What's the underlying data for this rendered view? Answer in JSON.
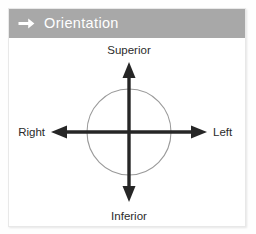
{
  "card": {
    "header": {
      "icon": "right-arrow-icon",
      "title": "Orientation",
      "background_color": "#a8a8a8",
      "text_color": "#ffffff"
    },
    "background_color": "#ffffff",
    "border_color": "#e8e8e8"
  },
  "diagram": {
    "name": "anatomical-orientation-diagram",
    "circle": {
      "stroke_color": "#9a9a9a",
      "fill": "none"
    },
    "axis_color": "#262626",
    "labels": {
      "top": "Superior",
      "bottom": "Inferior",
      "left": "Right",
      "right": "Left"
    }
  }
}
